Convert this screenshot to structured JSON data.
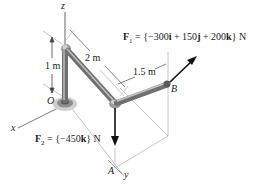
{
  "diagram": {
    "axes": {
      "x_label": "x",
      "y_label": "y",
      "z_label": "z"
    },
    "points": {
      "origin_label": "O",
      "point_a_label": "A",
      "point_b_label": "B"
    },
    "dimensions": {
      "vertical_height": "1 m",
      "diagonal_length": "2 m",
      "segment_length": "1.5 m"
    },
    "forces": {
      "f1": {
        "name": "F",
        "subscript": "1",
        "expression_prefix": " = {−300",
        "i": "i",
        "mid1": " + 150",
        "j": "j",
        "mid2": " + 200",
        "k": "k",
        "suffix": "} N",
        "direction": "up-right"
      },
      "f2": {
        "name": "F",
        "subscript": "2",
        "expression_prefix": " = {−450",
        "k": "k",
        "suffix": "} N",
        "direction": "down"
      }
    },
    "colors": {
      "pipe": "#8a8a8a",
      "pipe_highlight": "#c9c9c9",
      "arrow": "#111111",
      "construction_line": "#b5b5b5",
      "support": "#9a9a9a"
    }
  }
}
